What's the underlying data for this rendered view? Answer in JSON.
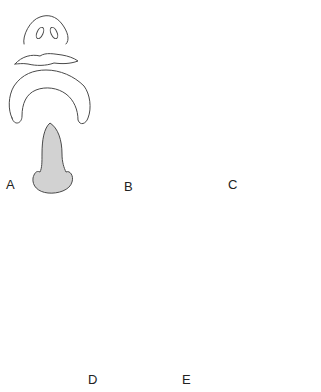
{
  "figure": {
    "type": "anatomical-diagram",
    "panels": [
      {
        "id": "A",
        "label": "A",
        "elements": [
          "nose",
          "upper-lip",
          "arch",
          "septum"
        ]
      },
      {
        "id": "B",
        "label": "B",
        "elements": [
          "nose",
          "upper-lip",
          "arch",
          "septum"
        ]
      },
      {
        "id": "C",
        "label": "C",
        "elements": [
          "nose",
          "upper-lip-shaded",
          "arch",
          "septum"
        ]
      },
      {
        "id": "D",
        "label": "D",
        "elements": [
          "nose-lip-fused",
          "lateral-segments",
          "septum"
        ]
      },
      {
        "id": "E",
        "label": "E",
        "elements": [
          "nose-lip-fused",
          "lateral-segments",
          "septum"
        ]
      }
    ],
    "colors": {
      "stroke": "#4a4a4a",
      "fill_gray": "#d2d2d2",
      "highlight": "#ececec",
      "background": "#ffffff"
    }
  }
}
